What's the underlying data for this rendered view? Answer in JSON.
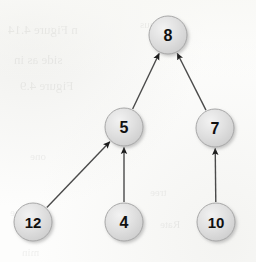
{
  "figure": {
    "width": 256,
    "height": 262,
    "background_color": "#fdfdfc"
  },
  "style": {
    "node_fill": "#dedede",
    "node_fill_highlight": "#efefef",
    "node_stroke": "#a8a8a8",
    "node_shadow": "#bdbdbd",
    "label_color": "#101010",
    "edge_color": "#4a4a4a",
    "arrowhead_color": "#1c1c1c",
    "node_radius": 19,
    "edge_width": 1.4
  },
  "chart_data": {
    "type": "diagram",
    "subtype": "directed-tree",
    "title": "",
    "nodes": [
      {
        "id": "n8",
        "label": "8",
        "x": 168,
        "y": 35,
        "r": 19,
        "level": 0
      },
      {
        "id": "n5",
        "label": "5",
        "x": 124,
        "y": 127,
        "r": 19,
        "level": 1
      },
      {
        "id": "n7",
        "label": "7",
        "x": 215,
        "y": 128,
        "r": 19,
        "level": 1
      },
      {
        "id": "n12",
        "label": "12",
        "x": 33,
        "y": 222,
        "r": 19,
        "level": 2
      },
      {
        "id": "n4",
        "label": "4",
        "x": 124,
        "y": 222,
        "r": 19,
        "level": 2
      },
      {
        "id": "n10",
        "label": "10",
        "x": 216,
        "y": 222,
        "r": 19,
        "level": 2
      }
    ],
    "edges": [
      {
        "id": "e1",
        "from": "n5",
        "to": "n8",
        "directed": true,
        "arrow_at": "to"
      },
      {
        "id": "e2",
        "from": "n7",
        "to": "n8",
        "directed": true,
        "arrow_at": "to"
      },
      {
        "id": "e3",
        "from": "n12",
        "to": "n5",
        "directed": true,
        "arrow_at": "to"
      },
      {
        "id": "e4",
        "from": "n4",
        "to": "n5",
        "directed": true,
        "arrow_at": "to"
      },
      {
        "id": "e5",
        "from": "n10",
        "to": "n7",
        "directed": true,
        "arrow_at": "to"
      }
    ],
    "node_values": [
      8,
      5,
      7,
      12,
      4,
      10
    ],
    "root": "n8",
    "leaves": [
      "n12",
      "n4",
      "n10"
    ],
    "legend": [],
    "annotations": []
  },
  "background_artifacts": {
    "description": "faint mirrored show-through text from the reverse side of the scanned page",
    "lines": [
      {
        "text": "n  Figure  4.14",
        "x": 8,
        "y": 22,
        "size": 13
      },
      {
        "text": "side  as  in",
        "x": 14,
        "y": 52,
        "size": 13
      },
      {
        "text": "Figure  4.9",
        "x": 20,
        "y": 78,
        "size": 13
      },
      {
        "text": "thus",
        "x": 140,
        "y": 18,
        "size": 11
      },
      {
        "text": "is",
        "x": 120,
        "y": 112,
        "size": 11
      },
      {
        "text": "one",
        "x": 30,
        "y": 150,
        "size": 11
      },
      {
        "text": "tree",
        "x": 150,
        "y": 186,
        "size": 11
      },
      {
        "text": "case",
        "x": 10,
        "y": 206,
        "size": 11
      },
      {
        "text": "Rate",
        "x": 160,
        "y": 218,
        "size": 11
      },
      {
        "text": "min",
        "x": 22,
        "y": 246,
        "size": 11
      }
    ]
  }
}
